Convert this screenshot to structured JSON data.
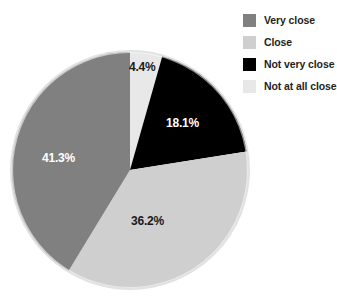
{
  "chart_data": {
    "type": "pie",
    "title": "",
    "subtitle": "",
    "xlabel": "",
    "ylabel": "",
    "grid": false,
    "legend_position": "right",
    "start_angle_deg": 0,
    "direction": "clockwise",
    "categories": [
      "Very close",
      "Close",
      "Not very close",
      "Not at all close"
    ],
    "values": [
      41.3,
      36.2,
      18.1,
      4.4
    ],
    "value_unit": "%",
    "colors": [
      "#808080",
      "#cfcfcf",
      "#000000",
      "#e8e8e8"
    ],
    "slices": [
      {
        "label": "Very close",
        "value": 41.3,
        "display": "41.3%",
        "color": "#808080",
        "label_color": "#ffffff"
      },
      {
        "label": "Close",
        "value": 36.2,
        "display": "36.2%",
        "color": "#cfcfcf",
        "label_color": "#1a1a1a"
      },
      {
        "label": "Not very close",
        "value": 18.1,
        "display": "18.1%",
        "color": "#000000",
        "label_color": "#ffffff"
      },
      {
        "label": "Not at all close",
        "value": 4.4,
        "display": "4.4%",
        "color": "#e8e8e8",
        "label_color": "#1a1a1a"
      }
    ]
  },
  "legend": {
    "items": [
      {
        "label": "Very close",
        "color": "#808080"
      },
      {
        "label": "Close",
        "color": "#cfcfcf"
      },
      {
        "label": "Not very close",
        "color": "#000000"
      },
      {
        "label": "Not at all close",
        "color": "#e8e8e8"
      }
    ]
  },
  "colors": {
    "background": "#ffffff",
    "pie_outline": "#d8d8d8",
    "text": "#231f20"
  }
}
